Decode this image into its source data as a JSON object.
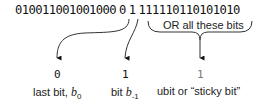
{
  "bits": {
    "leading": "010011001001000",
    "last_bit": "0",
    "bit_minus_1": "1",
    "trailing": "111110110101010"
  },
  "brace_label": "OR all these bits",
  "outputs": [
    {
      "value": "0",
      "label_prefix": "last bit, ",
      "label_var": "b",
      "label_sub": "0"
    },
    {
      "value": "1",
      "label_prefix": "bit ",
      "label_var": "b",
      "label_sub": "-1"
    },
    {
      "value": "1",
      "label": "ubit or “sticky bit”"
    }
  ],
  "colors": {
    "lines": "#222222",
    "ubit_value": "#777777"
  }
}
